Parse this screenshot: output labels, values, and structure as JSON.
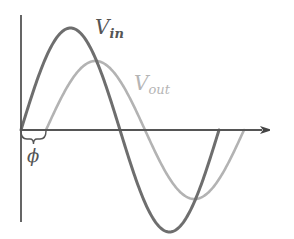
{
  "diagram": {
    "axes": {
      "color": "#555555",
      "origin": [
        21,
        130
      ],
      "y_axis": {
        "x": 21,
        "y_top": 15,
        "y_bottom": 222
      },
      "x_axis": {
        "y": 130,
        "x_start": 21,
        "x_end": 274
      }
    },
    "series": [
      {
        "name": "V_in",
        "label_main": "V",
        "label_sub": "in",
        "color": "#6e6e6e",
        "label_color": "#555555",
        "start_x": 21,
        "half_period": 99,
        "amplitude": 102
      },
      {
        "name": "V_out",
        "label_main": "V",
        "label_sub": "out",
        "color": "#b3b3b3",
        "label_color": "#b5b5b5",
        "start_x": 46,
        "half_period": 99,
        "amplitude": 69
      }
    ],
    "phase": {
      "symbol": "ϕ",
      "brace_from_x": 21,
      "brace_to_x": 46,
      "color": "#555555"
    }
  }
}
